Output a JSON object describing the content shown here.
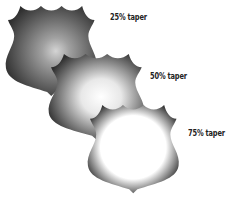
{
  "figure": {
    "shields": [
      {
        "id": "shield-25",
        "label": "25% taper",
        "taper": 25,
        "edge_color": "#2a2a2a",
        "center_color": "#c8c8c8"
      },
      {
        "id": "shield-50",
        "label": "50% taper",
        "taper": 50,
        "edge_color": "#2a2a2a",
        "center_color": "#ffffff"
      },
      {
        "id": "shield-75",
        "label": "75% taper",
        "taper": 75,
        "edge_color": "#2a2a2a",
        "center_color": "#ffffff"
      }
    ]
  }
}
